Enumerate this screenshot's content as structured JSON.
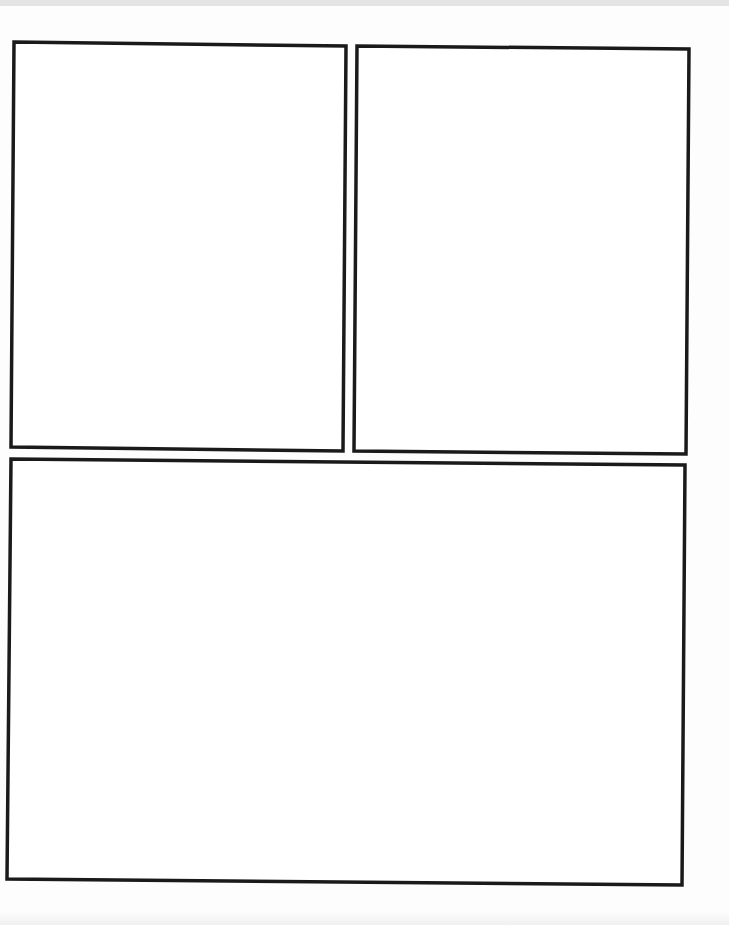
{
  "page": {
    "title": "",
    "panels": [
      {
        "id": "panel-1",
        "content": ""
      },
      {
        "id": "panel-2",
        "content": ""
      },
      {
        "id": "panel-3",
        "content": ""
      }
    ]
  }
}
